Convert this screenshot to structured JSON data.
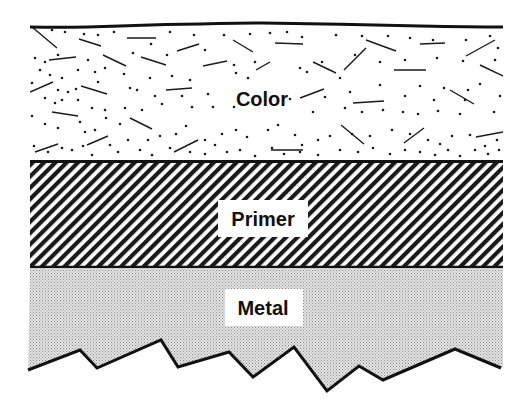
{
  "diagram": {
    "type": "layer-cross-section",
    "layers": [
      {
        "name": "Color",
        "pattern": "speckled-dots-and-dashes",
        "order": 1
      },
      {
        "name": "Primer",
        "pattern": "diagonal-hatch",
        "order": 2
      },
      {
        "name": "Metal",
        "pattern": "fine-stipple",
        "order": 3
      }
    ],
    "bottom_edge": "jagged-broken-line"
  },
  "labels": {
    "color": "Color",
    "primer": "Primer",
    "metal": "Metal"
  },
  "colors": {
    "ink": "#111111",
    "background": "#ffffff",
    "metal_fill": "#d6d6d6"
  }
}
